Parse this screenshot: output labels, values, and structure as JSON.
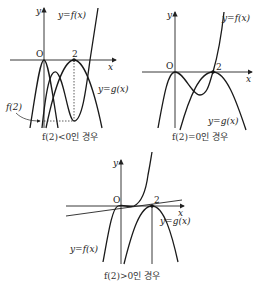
{
  "panels": [
    {
      "caption": "f(2)<0인 경우",
      "origin_label": "O",
      "x_label": "x",
      "y_label": "y",
      "tick_label": "2",
      "f_label": "y=f(x)",
      "g_label": "y=g(x)",
      "extra_label": "f(2)"
    },
    {
      "caption": "f(2)=0인 경우",
      "origin_label": "O",
      "x_label": "x",
      "y_label": "y",
      "tick_label": "2",
      "f_label": "y=f(x)",
      "g_label": "y=g(x)"
    },
    {
      "caption": "f(2)>0인 경우",
      "origin_label": "O",
      "x_label": "x",
      "y_label": "y",
      "tick_label": "2",
      "f_label": "y=f(x)",
      "g_label": "y=g(x)"
    }
  ]
}
